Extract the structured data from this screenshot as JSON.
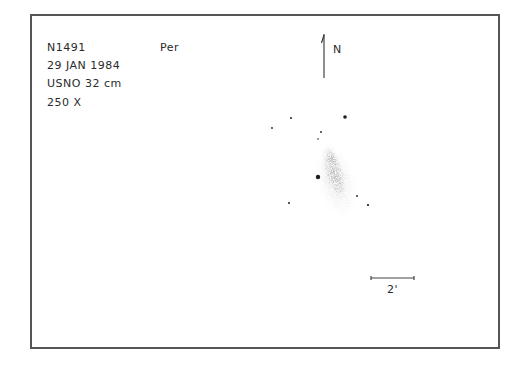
{
  "sketch": {
    "object": "N1491",
    "constellation": "Per",
    "date": "29 JAN 1984",
    "instrument": "USNO 32 cm",
    "magnification": "250 X"
  },
  "orientation": {
    "north_label": "N"
  },
  "scale_bar": {
    "label": "2'"
  },
  "colors": {
    "ink": "#2a2a2a",
    "frame": "#555555",
    "paper": "#ffffff"
  },
  "stars": [
    {
      "x": 291,
      "y": 118,
      "r": 1.0
    },
    {
      "x": 345,
      "y": 117,
      "r": 1.8
    },
    {
      "x": 272,
      "y": 128,
      "r": 0.9
    },
    {
      "x": 321,
      "y": 132,
      "r": 0.9
    },
    {
      "x": 318,
      "y": 139,
      "r": 0.8
    },
    {
      "x": 318,
      "y": 177,
      "r": 2.2
    },
    {
      "x": 289,
      "y": 203,
      "r": 1.0
    },
    {
      "x": 357,
      "y": 196,
      "r": 0.9
    },
    {
      "x": 368,
      "y": 205,
      "r": 1.1
    }
  ]
}
